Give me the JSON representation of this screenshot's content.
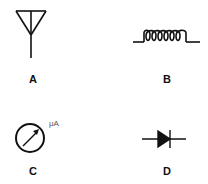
{
  "figure": {
    "stroke_color": "#111111",
    "background": "#ffffff",
    "symbols": [
      {
        "id": "A",
        "label": "A",
        "symbol": "antenna"
      },
      {
        "id": "B",
        "label": "B",
        "symbol": "inductor-coil"
      },
      {
        "id": "C",
        "label": "C",
        "symbol": "microammeter",
        "unit_text": "μA"
      },
      {
        "id": "D",
        "label": "D",
        "symbol": "diode"
      }
    ]
  }
}
